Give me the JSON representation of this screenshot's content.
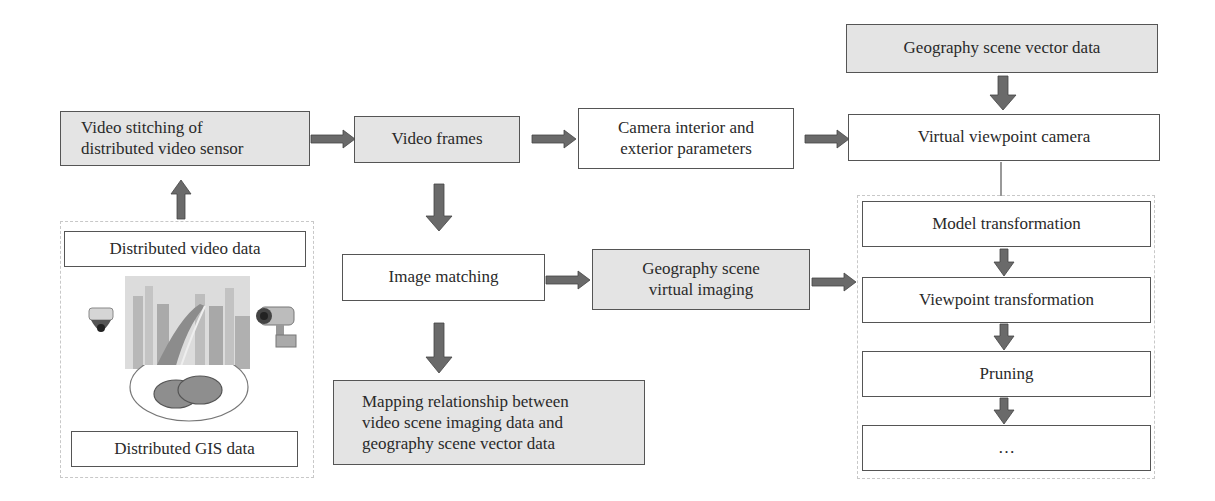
{
  "nodes": {
    "video_stitching": "Video stitching of\ndistributed video sensor",
    "video_frames": "Video frames",
    "camera_params": "Camera interior and\nexterior parameters",
    "geo_vector_data": "Geography scene vector data",
    "virtual_camera": "Virtual viewpoint camera",
    "model_transformation": "Model transformation",
    "viewpoint_transformation": "Viewpoint transformation",
    "pruning": "Pruning",
    "ellipsis": "…",
    "image_matching": "Image matching",
    "geo_virtual_imaging": "Geography scene\nvirtual imaging",
    "mapping_relationship": "Mapping relationship between\nvideo scene imaging data and\ngeography scene vector data",
    "distributed_video_data": "Distributed video data",
    "distributed_gis_data": "Distributed GIS data"
  },
  "edges": [
    {
      "from": "distributed_data_group",
      "to": "video_stitching"
    },
    {
      "from": "video_stitching",
      "to": "video_frames"
    },
    {
      "from": "video_frames",
      "to": "camera_params"
    },
    {
      "from": "camera_params",
      "to": "virtual_camera"
    },
    {
      "from": "geo_vector_data",
      "to": "virtual_camera"
    },
    {
      "from": "virtual_camera",
      "to": "pipeline_group",
      "style": "line"
    },
    {
      "from": "video_frames",
      "to": "image_matching"
    },
    {
      "from": "image_matching",
      "to": "geo_virtual_imaging"
    },
    {
      "from": "geo_virtual_imaging",
      "to": "viewpoint_transformation"
    },
    {
      "from": "image_matching",
      "to": "mapping_relationship"
    },
    {
      "from": "model_transformation",
      "to": "viewpoint_transformation"
    },
    {
      "from": "viewpoint_transformation",
      "to": "pruning"
    },
    {
      "from": "pruning",
      "to": "ellipsis"
    }
  ],
  "icons": [
    "dome-camera-icon",
    "bullet-camera-icon",
    "city-video-image",
    "gis-overlap-ellipses-icon"
  ],
  "colors": {
    "gray_box": "#e4e4e4",
    "arrow": "#6a6a6a",
    "border": "#555555",
    "dashed_group": "#c8c8c8"
  }
}
